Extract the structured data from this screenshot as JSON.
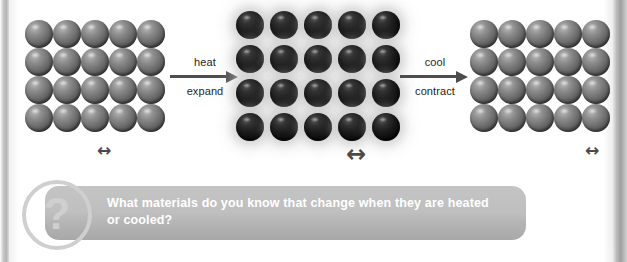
{
  "diagram": {
    "title_alt": "particle model of thermal expansion and contraction",
    "states": [
      {
        "id": "cold-solid-left",
        "name": "cool-particles-grid-left",
        "style": "cool",
        "columns": 5,
        "rows": 4,
        "spacing_px": 28,
        "spacing_arrow": "↔",
        "spacing_arrow_size_px": 17
      },
      {
        "id": "hot-solid-middle",
        "name": "hot-particles-grid-middle",
        "style": "hot",
        "columns": 5,
        "rows": 4,
        "spacing_px": 34,
        "spacing_arrow": "↔",
        "spacing_arrow_size_px": 24
      },
      {
        "id": "cold-solid-right",
        "name": "cool-particles-grid-right",
        "style": "cool",
        "columns": 5,
        "rows": 4,
        "spacing_px": 28,
        "spacing_arrow": "↔",
        "spacing_arrow_size_px": 17
      }
    ],
    "transitions": [
      {
        "id": "heat",
        "top_label": "heat",
        "bottom_label": "expand",
        "arrow": "→",
        "direction": "right"
      },
      {
        "id": "cool",
        "top_label": "cool",
        "bottom_label": "contract",
        "arrow": "→",
        "direction": "right"
      }
    ]
  },
  "question_banner": {
    "icon": "question-mark-icon",
    "icon_glyph": "?",
    "text": "What materials do you know that change when they are heated or cooled?",
    "background_color": "#bfbfbf",
    "text_color": "#ffffff",
    "icon_color": "#cfcfcf"
  },
  "colors": {
    "page_background": "#ffffff",
    "cool_particle": "#6e6e6e",
    "hot_particle": "#0d0d0d",
    "hot_glow": "#bebebe",
    "arrow": "#4d4d4d",
    "label_text": "#252525",
    "page_edge": "#b3b3b3"
  }
}
